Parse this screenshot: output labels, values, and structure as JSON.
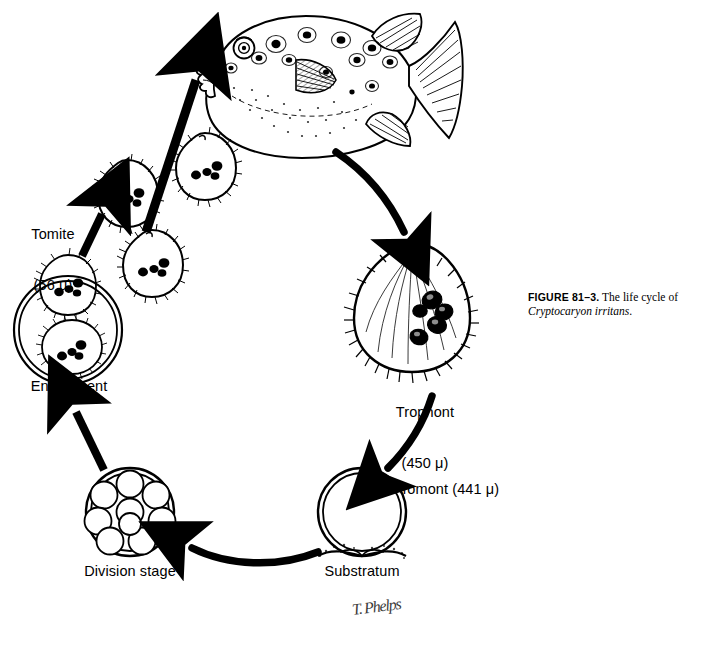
{
  "figure": {
    "number_label": "FIGURE 81–3.",
    "caption_text": " The life cycle of ",
    "species": "Cryptocaryon irritans",
    "caption_end": ".",
    "artist_signature": "T. Phelps"
  },
  "stages": {
    "tomite": {
      "label": "Tomite",
      "size": "(56 μ)",
      "count_drawn": 4,
      "icon": "ciliated-teardrop-cell"
    },
    "fish": {
      "label": "",
      "icon": "spotted-pufferfish"
    },
    "trophont": {
      "label": "Trophont",
      "size": "(450 μ)",
      "icon": "ciliated-pear-cell-with-horseshoe-macronucleus"
    },
    "tomont": {
      "label": "Tomont (441 μ)",
      "icon": "double-walled-cyst"
    },
    "substratum": {
      "label": "Substratum",
      "icon": "substrate-ground"
    },
    "division": {
      "label": "Division stage",
      "icon": "cyst-with-daughter-cells",
      "daughter_cells": 9
    },
    "encystment": {
      "label": "Encystment",
      "icon": "cyst-containing-ciliated-cells"
    }
  },
  "arrows": [
    {
      "name": "tomite-to-fish",
      "from": "tomite",
      "to": "fish",
      "style": "straight-bold"
    },
    {
      "name": "fish-to-trophont",
      "from": "fish",
      "to": "trophont",
      "style": "curved-bold"
    },
    {
      "name": "trophont-to-tomont",
      "from": "trophont",
      "to": "tomont",
      "style": "curved-bold"
    },
    {
      "name": "tomont-to-division",
      "from": "tomont",
      "to": "division",
      "style": "curved-bold"
    },
    {
      "name": "division-to-encystment",
      "from": "division",
      "to": "encystment",
      "style": "straight-bold"
    },
    {
      "name": "encystment-to-tomite",
      "from": "encystment",
      "to": "tomite",
      "style": "straight-bold"
    }
  ],
  "colors": {
    "ink": "#000000",
    "background": "#ffffff"
  }
}
